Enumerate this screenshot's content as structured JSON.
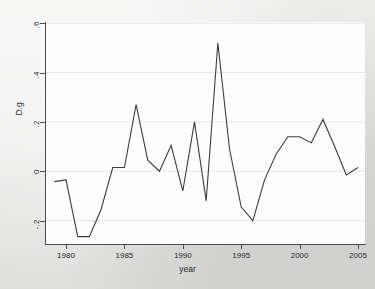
{
  "chart_data": {
    "type": "line",
    "title": "",
    "xlabel": "year",
    "ylabel": "D.g",
    "xlim": [
      1978.2,
      2005.6
    ],
    "ylim": [
      -0.295,
      0.605
    ],
    "grid": true,
    "grid_axis": "y",
    "legend": "none",
    "xticks": [
      1980,
      1985,
      1990,
      1995,
      2000,
      2005
    ],
    "xtick_labels": [
      "1980",
      "1985",
      "1990",
      "1995",
      "2000",
      "2005"
    ],
    "yticks": [
      -0.2,
      0,
      0.2,
      0.4,
      0.6
    ],
    "ytick_labels": [
      "-.2",
      "0",
      ".2",
      ".4",
      ".6"
    ],
    "series": [
      {
        "name": "D.g",
        "color": "#3c3c3c",
        "x": [
          1979,
          1980,
          1981,
          1982,
          1983,
          1984,
          1985,
          1986,
          1987,
          1988,
          1989,
          1990,
          1991,
          1992,
          1993,
          1994,
          1995,
          1996,
          1997,
          1998,
          1999,
          2000,
          2001,
          2002,
          2003,
          2004,
          2005
        ],
        "values": [
          -0.042,
          -0.035,
          -0.265,
          -0.265,
          -0.155,
          0.015,
          0.015,
          0.27,
          0.045,
          0.0,
          0.105,
          -0.08,
          0.2,
          -0.12,
          0.52,
          0.09,
          -0.145,
          -0.2,
          -0.035,
          0.07,
          0.14,
          0.14,
          0.115,
          0.21,
          0.1,
          -0.015,
          0.015
        ]
      }
    ]
  }
}
